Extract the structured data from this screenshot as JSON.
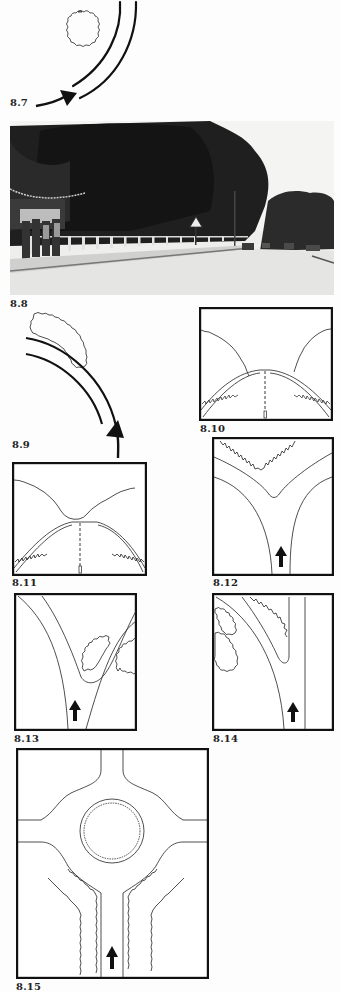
{
  "page": {
    "type": "book page of figures"
  },
  "figures": [
    {
      "id": "8.7",
      "caption": "8.7",
      "kind": "diagram",
      "content": "plan view of curved road with circular tree clump on inside of bend and arrow showing direction of travel"
    },
    {
      "id": "8.8",
      "caption": "8.8",
      "kind": "photograph",
      "content": "street scene with large trees, white fence, pedestrians on left footpath, cars in distance, road sign"
    },
    {
      "id": "8.9",
      "caption": "8.9",
      "kind": "diagram",
      "content": "plan view of curved road with elongated tree belt on outside of bend and arrow approaching from below"
    },
    {
      "id": "8.10",
      "caption": "8.10",
      "kind": "diagram",
      "content": "driver's perspective of road curving with trees on both sides meeting near horizon, dashed centre line"
    },
    {
      "id": "8.11",
      "caption": "8.11",
      "kind": "diagram",
      "content": "driver's perspective of road with tree masses crossing over the horizon, dashed centre line"
    },
    {
      "id": "8.12",
      "caption": "8.12",
      "kind": "diagram",
      "content": "plan of Y-junction with trees in the fork, arrow on approach road"
    },
    {
      "id": "8.13",
      "caption": "8.13",
      "kind": "diagram",
      "content": "plan of Y-junction with two tree clumps on the right side, arrow on approach road"
    },
    {
      "id": "8.14",
      "caption": "8.14",
      "kind": "diagram",
      "content": "plan of junction with tree clumps on left and fork, straight road on right, arrow on approach"
    },
    {
      "id": "8.15",
      "caption": "8.15",
      "kind": "diagram",
      "content": "plan of roundabout with planted central island and tree belts lining the approach road, arrow on approach"
    }
  ]
}
